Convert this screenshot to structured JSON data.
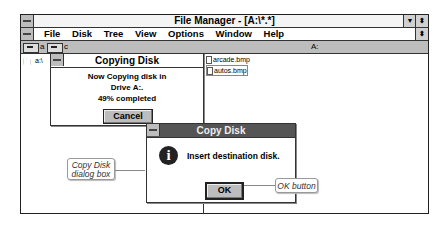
{
  "main_window": {
    "title": "File Manager - [A:\\*.*]",
    "menu": [
      "File",
      "Disk",
      "Tree",
      "View",
      "Options",
      "Window",
      "Help"
    ],
    "drives": [
      {
        "letter": "a",
        "icon": "floppy-drive-icon"
      },
      {
        "letter": "c",
        "icon": "hard-drive-icon"
      }
    ],
    "drive_path": "A:",
    "tree_root": "a:\\",
    "files": [
      "arcade.bmp",
      "autos.bmp"
    ]
  },
  "copying_dialog": {
    "title": "Copying Disk",
    "line1": "Now Copying disk in",
    "line2": "Drive A:.",
    "progress": "49% completed",
    "cancel_label": "Cancel"
  },
  "copy_disk_dialog": {
    "title": "Copy Disk",
    "message": "Insert destination disk.",
    "ok_label": "OK",
    "icon": "info-icon"
  },
  "callouts": {
    "dialog_box": "Copy Disk dialog box",
    "ok_button": "OK button"
  }
}
